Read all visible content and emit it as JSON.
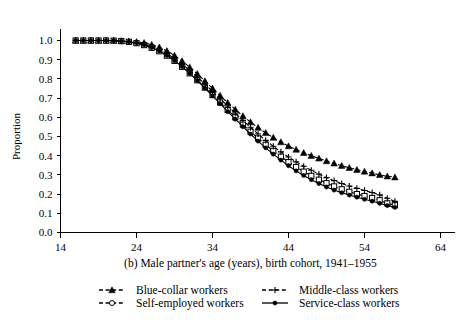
{
  "chart_data": {
    "type": "line",
    "title": "",
    "caption": "(b) Male partner's age (years), birth cohort, 1941–1955",
    "xlabel": "",
    "ylabel": "Proportion",
    "xlim": [
      14,
      64
    ],
    "ylim": [
      0.0,
      1.0
    ],
    "xticks": [
      14,
      24,
      34,
      44,
      54,
      64
    ],
    "xtick_labels": [
      "14",
      "24",
      "34",
      "44",
      "54",
      "64"
    ],
    "yticks": [
      0.0,
      0.1,
      0.2,
      0.3,
      0.4,
      0.5,
      0.6,
      0.7,
      0.8,
      0.9,
      1.0
    ],
    "ytick_labels": [
      "0.0",
      "0.1",
      "0.2",
      "0.3",
      "0.4",
      "0.5",
      "0.6",
      "0.7",
      "0.8",
      "0.9",
      "1.0"
    ],
    "grid": false,
    "legend_position": "below",
    "x": [
      16,
      17,
      18,
      19,
      20,
      21,
      22,
      23,
      24,
      25,
      26,
      27,
      28,
      29,
      30,
      31,
      32,
      33,
      34,
      35,
      36,
      37,
      38,
      39,
      40,
      41,
      42,
      43,
      44,
      45,
      46,
      47,
      48,
      49,
      50,
      51,
      52,
      53,
      54,
      55,
      56,
      57,
      58
    ],
    "series": [
      {
        "name": "Blue-collar workers",
        "marker": "filled-triangle",
        "linestyle": "dashed",
        "color": "#000000",
        "values": [
          1.0,
          1.0,
          1.0,
          1.0,
          1.0,
          1.0,
          0.998,
          0.996,
          0.993,
          0.988,
          0.978,
          0.965,
          0.946,
          0.922,
          0.893,
          0.861,
          0.826,
          0.789,
          0.751,
          0.713,
          0.676,
          0.641,
          0.607,
          0.575,
          0.546,
          0.519,
          0.494,
          0.471,
          0.45,
          0.432,
          0.415,
          0.4,
          0.386,
          0.372,
          0.36,
          0.348,
          0.337,
          0.327,
          0.318,
          0.309,
          0.3,
          0.293,
          0.288
        ]
      },
      {
        "name": "Self-employed workers",
        "marker": "open-square",
        "linestyle": "dashed",
        "color": "#000000",
        "values": [
          1.0,
          1.0,
          1.0,
          1.0,
          1.0,
          0.999,
          0.997,
          0.993,
          0.986,
          0.976,
          0.962,
          0.944,
          0.921,
          0.894,
          0.863,
          0.829,
          0.793,
          0.755,
          0.716,
          0.677,
          0.638,
          0.6,
          0.562,
          0.525,
          0.49,
          0.457,
          0.425,
          0.395,
          0.367,
          0.341,
          0.317,
          0.295,
          0.275,
          0.257,
          0.24,
          0.225,
          0.212,
          0.2,
          0.19,
          0.18,
          0.168,
          0.152,
          0.142
        ]
      },
      {
        "name": "Middle-class workers",
        "marker": "plus",
        "linestyle": "dashed",
        "color": "#000000",
        "values": [
          1.0,
          1.0,
          1.0,
          1.0,
          1.0,
          0.999,
          0.997,
          0.994,
          0.989,
          0.981,
          0.969,
          0.953,
          0.932,
          0.906,
          0.877,
          0.845,
          0.81,
          0.773,
          0.735,
          0.697,
          0.659,
          0.621,
          0.584,
          0.548,
          0.513,
          0.48,
          0.449,
          0.42,
          0.393,
          0.368,
          0.345,
          0.324,
          0.304,
          0.286,
          0.27,
          0.255,
          0.242,
          0.23,
          0.219,
          0.208,
          0.196,
          0.178,
          0.162
        ]
      },
      {
        "name": "Service-class workers",
        "marker": "filled-circle",
        "linestyle": "solid",
        "color": "#000000",
        "values": [
          1.0,
          1.0,
          1.0,
          1.0,
          1.0,
          0.999,
          0.997,
          0.993,
          0.987,
          0.977,
          0.963,
          0.945,
          0.922,
          0.895,
          0.864,
          0.829,
          0.791,
          0.752,
          0.712,
          0.671,
          0.63,
          0.59,
          0.551,
          0.513,
          0.476,
          0.441,
          0.408,
          0.377,
          0.348,
          0.321,
          0.297,
          0.275,
          0.255,
          0.237,
          0.221,
          0.207,
          0.195,
          0.184,
          0.173,
          0.163,
          0.152,
          0.14,
          0.131
        ]
      }
    ]
  },
  "legend": {
    "entries": [
      {
        "label": "Blue-collar workers",
        "marker": "filled-triangle",
        "linestyle": "dashed"
      },
      {
        "label": "Self-employed workers",
        "marker": "open-circle",
        "linestyle": "dashed"
      },
      {
        "label": "Middle-class workers",
        "marker": "plus",
        "linestyle": "dashed"
      },
      {
        "label": "Service-class workers",
        "marker": "filled-circle",
        "linestyle": "solid"
      }
    ]
  }
}
